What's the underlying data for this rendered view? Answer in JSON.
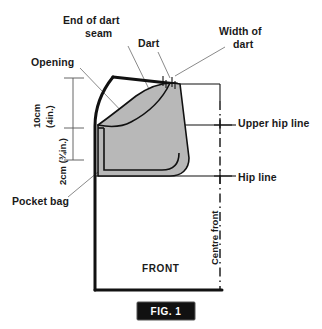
{
  "figure": {
    "caption": "FIG. 1",
    "caption_box_color": "#111111",
    "caption_text_color": "#ffffff"
  },
  "colors": {
    "pocket_fill": "#b8b8b8",
    "line": "#111111",
    "leader": "#8a8a8a",
    "background": "#ffffff"
  },
  "labels": {
    "end_of_dart_seam_line1": "End of dart",
    "end_of_dart_seam_line2": "seam",
    "dart": "Dart",
    "width_of_dart_line1": "Width of",
    "width_of_dart_line2": "dart",
    "opening": "Opening",
    "upper_hip_line": "Upper hip line",
    "hip_line": "Hip line",
    "pocket_bag": "Pocket bag",
    "centre_front": "Centre front",
    "front": "FRONT"
  },
  "measurements": {
    "upper_line1": "10cm",
    "upper_line2": "(4in.)",
    "lower": "2cm (¾in.)"
  }
}
